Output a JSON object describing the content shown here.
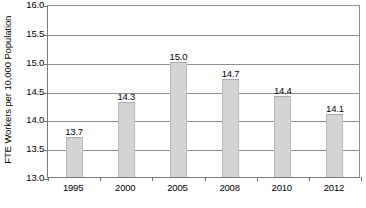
{
  "chart_data": {
    "type": "bar",
    "title": "",
    "subtitle": "",
    "xlabel": "",
    "ylabel": "FTE Workers per 10,000 Population",
    "categories": [
      "1995",
      "2000",
      "2005",
      "2008",
      "2010",
      "2012"
    ],
    "values": [
      13.7,
      14.3,
      15.0,
      14.7,
      14.4,
      14.1
    ],
    "data_labels": [
      "13.7",
      "14.3",
      "15.0",
      "14.7",
      "14.4",
      "14.1"
    ],
    "ylim": [
      13.0,
      16.0
    ],
    "ytick_values": [
      13.0,
      13.5,
      14.0,
      14.5,
      15.0,
      15.5,
      16.0
    ],
    "ytick_labels": [
      "13.0",
      "13.5",
      "14.0",
      "14.5",
      "15.0",
      "15.5",
      "16.0"
    ],
    "grid": "horizontal",
    "legend": "none",
    "bar_color": "#d4d4d4",
    "bar_border_color": "#b9b9b9",
    "gridline_color": "#8f8f8f",
    "axis_color": "#7b7b7b",
    "text_color": "#000000"
  }
}
